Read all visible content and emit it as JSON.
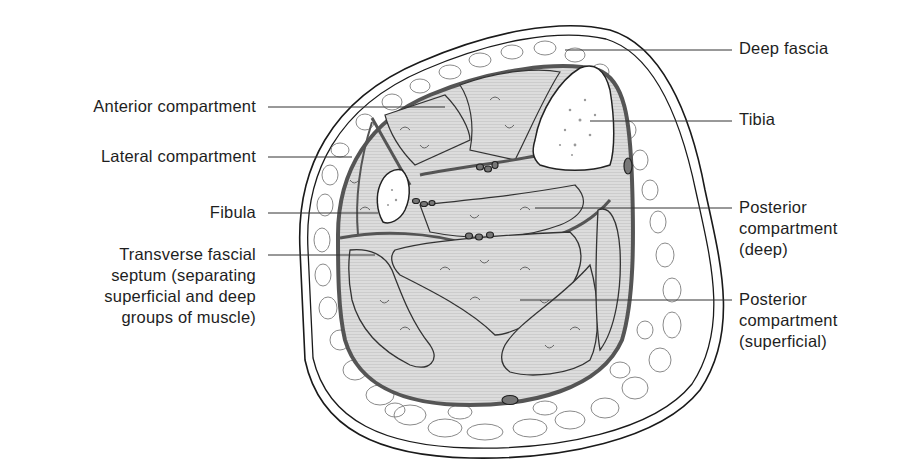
{
  "figure": {
    "colors": {
      "outline": "#1a1a1a",
      "fascia": "#555555",
      "muscle_fill": "#d6d6d6",
      "fat_cell_stroke": "#8a8a8a",
      "bone_fill": "#ffffff",
      "vessel_fill": "#777777",
      "leader_line": "#333333"
    }
  },
  "labels": {
    "left": [
      {
        "id": "anterior-compartment",
        "text": "Anterior compartment"
      },
      {
        "id": "lateral-compartment",
        "text": "Lateral compartment"
      },
      {
        "id": "fibula",
        "text": "Fibula"
      },
      {
        "id": "transverse-fascial-septum",
        "text": "Transverse fascial\nseptum (separating\nsuperficial and deep\ngroups of muscle)"
      }
    ],
    "right": [
      {
        "id": "deep-fascia",
        "text": "Deep fascia"
      },
      {
        "id": "tibia",
        "text": "Tibia"
      },
      {
        "id": "posterior-compartment-deep",
        "text": "Posterior\ncompartment\n(deep)"
      },
      {
        "id": "posterior-compartment-superficial",
        "text": "Posterior\ncompartment\n(superficial)"
      }
    ]
  }
}
